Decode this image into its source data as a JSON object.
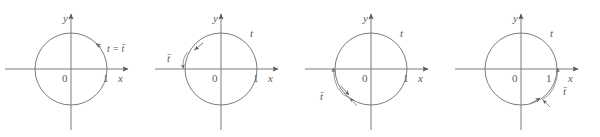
{
  "figure": {
    "type": "math-diagram",
    "background_color": "#ffffff",
    "line_color": "#7d7d7d",
    "label_color": "#5a5a5a",
    "panel_count": 4
  },
  "common": {
    "y_axis_label": "y",
    "x_axis_label": "x",
    "origin_label": "0",
    "unit_label": "1",
    "t_label": "t",
    "t_bar_label": "t̄"
  },
  "panels": [
    {
      "id": "panel-1",
      "index": 1,
      "quadrant": 1,
      "y_axis_label": "y",
      "x_axis_label": "x",
      "origin_label": "0",
      "unit_label": "1",
      "terminal_label": "t = t̄",
      "t_bar_label": "",
      "arc_direction": "counterclockwise",
      "terminal_point_angle_deg": 45,
      "reference_arc": "none"
    },
    {
      "id": "panel-2",
      "index": 2,
      "quadrant": 2,
      "y_axis_label": "y",
      "x_axis_label": "x",
      "origin_label": "0",
      "unit_label": "1",
      "terminal_label": "t",
      "t_bar_label": "t̄",
      "arc_direction": "counterclockwise",
      "terminal_point_angle_deg": 160,
      "reference_arc": "short-arc-left-above-x-axis"
    },
    {
      "id": "panel-3",
      "index": 3,
      "quadrant": 3,
      "y_axis_label": "y",
      "x_axis_label": "x",
      "origin_label": "0",
      "unit_label": "1",
      "terminal_label": "t",
      "t_bar_label": "t̄",
      "arc_direction": "counterclockwise",
      "terminal_point_angle_deg": 230,
      "reference_arc": "arc-from-180-to-230-outside-lower-left"
    },
    {
      "id": "panel-4",
      "index": 4,
      "quadrant": 4,
      "y_axis_label": "y",
      "x_axis_label": "x",
      "origin_label": "0",
      "unit_label": "1",
      "terminal_label": "t",
      "t_bar_label": "t̄",
      "arc_direction": "counterclockwise",
      "terminal_point_angle_deg": 305,
      "reference_arc": "arc-from-305-to-360-outside-lower-right"
    }
  ]
}
